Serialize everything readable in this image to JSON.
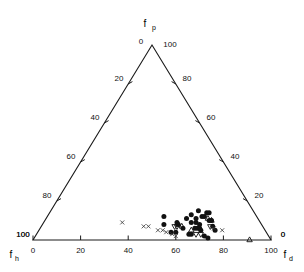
{
  "chart_data": {
    "type": "scatter",
    "plot_kind": "ternary",
    "title": "",
    "axes": {
      "top": {
        "name": "f_p",
        "label": "f",
        "sub": "p",
        "min": 0,
        "max": 100,
        "ticks": [
          0,
          20,
          40,
          60,
          80,
          100
        ]
      },
      "left": {
        "name": "f_h",
        "label": "f",
        "sub": "h",
        "min": 0,
        "max": 100,
        "ticks": [
          0,
          20,
          40,
          60,
          80,
          100
        ]
      },
      "right": {
        "name": "f_d",
        "label": "f",
        "sub": "d",
        "min": 0,
        "max": 100,
        "ticks": [
          0,
          20,
          40,
          60,
          80,
          100
        ]
      }
    },
    "corner_labels": {
      "apex_left": "0",
      "apex_right": "100",
      "bottom_left_upper": "100",
      "bottom_left_lower": "0",
      "bottom_right_upper": "0",
      "bottom_right_lower": "100"
    },
    "left_axis_tick_labels": [
      "20",
      "40",
      "60",
      "80",
      "100"
    ],
    "right_axis_tick_labels": [
      "80",
      "60",
      "40",
      "20",
      "0"
    ],
    "bottom_axis_tick_labels": [
      "0",
      "20",
      "40",
      "60",
      "80",
      "100"
    ],
    "grid": false,
    "legend": "none",
    "colors": {
      "axis": "#1a1a1a",
      "circle_marker": "#111111",
      "triangle_marker": "#111111",
      "cross_marker": "#333333",
      "background": "#ffffff"
    },
    "series": [
      {
        "name": "filled-circle",
        "marker": "circle",
        "points": [
          {
            "fd": 62,
            "fh": 23,
            "fp": 15
          },
          {
            "fd": 66,
            "fh": 20,
            "fp": 14
          },
          {
            "fd": 67,
            "fh": 19,
            "fp": 14
          },
          {
            "fd": 60,
            "fh": 27,
            "fp": 13
          },
          {
            "fd": 65,
            "fh": 23,
            "fp": 12
          },
          {
            "fd": 66,
            "fh": 22,
            "fp": 12
          },
          {
            "fd": 49,
            "fh": 39,
            "fp": 12
          },
          {
            "fd": 59,
            "fh": 30,
            "fp": 11
          },
          {
            "fd": 63,
            "fh": 26,
            "fp": 11
          },
          {
            "fd": 69,
            "fh": 21,
            "fp": 10
          },
          {
            "fd": 70,
            "fh": 20,
            "fp": 10
          },
          {
            "fd": 56,
            "fh": 35,
            "fp": 9
          },
          {
            "fd": 62,
            "fh": 29,
            "fp": 9
          },
          {
            "fd": 64,
            "fh": 27,
            "fp": 9
          },
          {
            "fd": 51,
            "fh": 41,
            "fp": 8
          },
          {
            "fd": 57,
            "fh": 35,
            "fp": 8
          },
          {
            "fd": 66,
            "fh": 26,
            "fp": 8
          },
          {
            "fd": 72,
            "fh": 21,
            "fp": 7
          },
          {
            "fd": 60,
            "fh": 34,
            "fp": 6
          },
          {
            "fd": 65,
            "fh": 29,
            "fp": 6
          },
          {
            "fd": 66,
            "fh": 28,
            "fp": 6
          },
          {
            "fd": 67,
            "fh": 27,
            "fp": 6
          },
          {
            "fd": 68,
            "fh": 27,
            "fp": 5
          },
          {
            "fd": 74,
            "fh": 21,
            "fp": 5
          },
          {
            "fd": 56,
            "fh": 40,
            "fp": 4
          },
          {
            "fd": 58,
            "fh": 38,
            "fp": 4
          },
          {
            "fd": 64,
            "fh": 33,
            "fp": 3
          },
          {
            "fd": 65,
            "fh": 32,
            "fp": 3
          },
          {
            "fd": 71,
            "fh": 27,
            "fp": 2
          },
          {
            "fd": 73,
            "fh": 26,
            "fp": 1
          }
        ]
      },
      {
        "name": "open-triangle-up",
        "marker": "triangle-up",
        "points": [
          {
            "fd": 68,
            "fh": 21,
            "fp": 11
          },
          {
            "fd": 70,
            "fh": 20,
            "fp": 10
          },
          {
            "fd": 57,
            "fh": 35,
            "fp": 8
          },
          {
            "fd": 59,
            "fh": 34,
            "fp": 7
          },
          {
            "fd": 64,
            "fh": 31,
            "fp": 5
          },
          {
            "fd": 91,
            "fh": 9,
            "fp": 0
          }
        ]
      },
      {
        "name": "open-triangle-down",
        "marker": "triangle-down",
        "points": [
          {
            "fd": 71,
            "fh": 22,
            "fp": 7
          },
          {
            "fd": 56,
            "fh": 37,
            "fp": 7
          },
          {
            "fd": 57,
            "fh": 36,
            "fp": 7
          },
          {
            "fd": 69,
            "fh": 28,
            "fp": 3
          },
          {
            "fd": 67,
            "fh": 30,
            "fp": 3
          }
        ]
      },
      {
        "name": "cross",
        "marker": "x",
        "points": [
          {
            "fd": 33,
            "fh": 58,
            "fp": 9
          },
          {
            "fd": 45,
            "fh": 48,
            "fp": 7
          },
          {
            "fd": 43,
            "fh": 50,
            "fp": 7
          },
          {
            "fd": 50,
            "fh": 45,
            "fp": 5
          },
          {
            "fd": 52,
            "fh": 43,
            "fp": 5
          },
          {
            "fd": 54,
            "fh": 42,
            "fp": 4
          },
          {
            "fd": 57,
            "fh": 40,
            "fp": 3
          },
          {
            "fd": 59,
            "fh": 39,
            "fp": 2
          },
          {
            "fd": 73,
            "fh": 21,
            "fp": 6
          },
          {
            "fd": 77,
            "fh": 18,
            "fp": 5
          }
        ]
      }
    ]
  }
}
